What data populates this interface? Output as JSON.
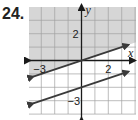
{
  "problem": {
    "number": "24."
  },
  "colors": {
    "shade": "#d6d6d6",
    "grid": "#a0a0a0",
    "axis": "#1a1a1a",
    "line": "#3a3a3a",
    "background": "#ffffff"
  },
  "chart_data": {
    "type": "line",
    "title": "",
    "xlabel": "x",
    "ylabel": "y",
    "xlim": [
      -4,
      4
    ],
    "ylim": [
      -4,
      4
    ],
    "grid": true,
    "tick_labels": {
      "x": [
        {
          "value": -3,
          "label": "−3"
        },
        {
          "value": 2,
          "label": "2"
        }
      ],
      "y": [
        {
          "value": 2,
          "label": "2"
        },
        {
          "value": -3,
          "label": "−3"
        }
      ]
    },
    "series": [
      {
        "name": "boundary 1",
        "equation": "y = (1/3)x",
        "slope": 0.3333,
        "intercept": 0,
        "style": "solid",
        "arrows": "both"
      },
      {
        "name": "boundary 2",
        "equation": "y = (1/3)x - 2",
        "slope": 0.3333,
        "intercept": -2,
        "style": "solid",
        "arrows": "both"
      }
    ],
    "shaded_region": {
      "description": "region above y = (1/3)x",
      "inequality": "y >= (1/3)x"
    }
  }
}
